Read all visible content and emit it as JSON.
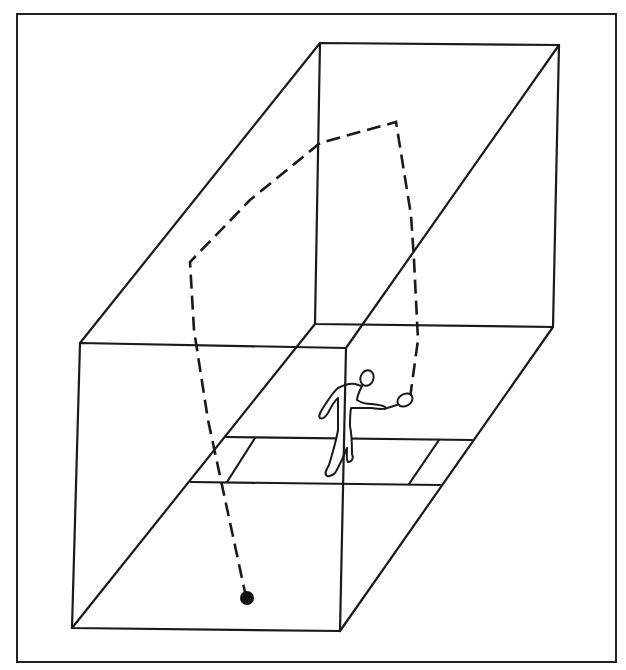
{
  "diagram": {
    "title": "Racquetball court — ceiling ball shot trajectory",
    "colors": {
      "ink": "#1a1a1a",
      "background": "#ffffff",
      "ball": "#111111"
    },
    "frame": {
      "x1": 17,
      "y1": 14,
      "x2": 616,
      "y2": 662
    },
    "court": {
      "back_wall": [
        [
          320,
          43
        ],
        [
          559,
          45
        ],
        [
          553,
          327
        ],
        [
          315,
          324
        ]
      ],
      "front_wall": [
        [
          80,
          343
        ],
        [
          346,
          348
        ],
        [
          340,
          631
        ],
        [
          72,
          628
        ]
      ],
      "edges": [
        [
          [
            320,
            43
          ],
          [
            80,
            343
          ]
        ],
        [
          [
            559,
            45
          ],
          [
            346,
            348
          ]
        ],
        [
          [
            315,
            324
          ],
          [
            72,
            628
          ]
        ],
        [
          [
            553,
            327
          ],
          [
            340,
            631
          ]
        ]
      ],
      "service_zone": {
        "short_line": [
          [
            226,
            437
          ],
          [
            472,
            440
          ]
        ],
        "service_line": [
          [
            191,
            482
          ],
          [
            440,
            485
          ]
        ],
        "left_box_line": [
          [
            255,
            438
          ],
          [
            227,
            482
          ]
        ],
        "right_box_line": [
          [
            439,
            440
          ],
          [
            409,
            484
          ]
        ]
      }
    },
    "trajectory": {
      "label": "ball path (dashed)",
      "points": [
        [
          410,
          398
        ],
        [
          418,
          340
        ],
        [
          412,
          225
        ],
        [
          396,
          122
        ],
        [
          320,
          143
        ],
        [
          250,
          200
        ],
        [
          190,
          262
        ],
        [
          208,
          420
        ],
        [
          246,
          597
        ]
      ]
    },
    "ball": {
      "cx": 247,
      "cy": 598,
      "r": 7,
      "label": "ball"
    },
    "player": {
      "label": "player swinging racquet",
      "racquet_head": [
        404,
        402
      ]
    }
  }
}
